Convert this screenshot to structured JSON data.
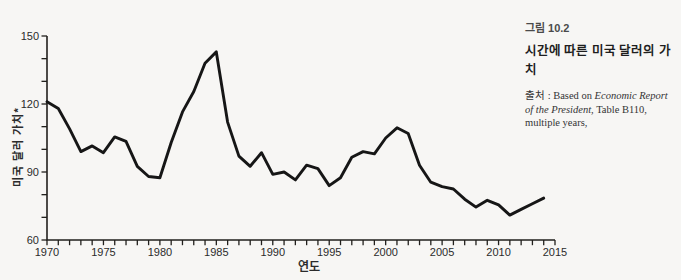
{
  "page": {
    "background_color": "#f7f6f4",
    "line_color": "#161616"
  },
  "figure_caption": {
    "number": "그림 10.2",
    "title": "시간에 따른 미국 달러의 가치",
    "source_label": "출처 : ",
    "source_before_italic": "Based on ",
    "source_italic": "Economic Report of the President",
    "source_after_italic": ", Table B110, multiple years,"
  },
  "chart_data": {
    "type": "line",
    "title": "",
    "xlabel": "연도",
    "ylabel": "미국 달러 가치*",
    "xlim": [
      1970,
      2015
    ],
    "ylim": [
      60,
      150
    ],
    "grid": false,
    "legend": "none",
    "x_tick_labels": [
      "1970",
      "1975",
      "1980",
      "1985",
      "1990",
      "1995",
      "2000",
      "2005",
      "2010",
      "2015"
    ],
    "y_tick_labels": [
      "150",
      "120",
      "90",
      "60"
    ],
    "x_minor_tick_step_years": 1,
    "y_minor_tick_step": 10,
    "series_name": "미국 달러 가치 (US dollar value index)",
    "x": [
      1970,
      1971,
      1972,
      1973,
      1974,
      1975,
      1976,
      1977,
      1978,
      1979,
      1980,
      1981,
      1982,
      1983,
      1984,
      1985,
      1986,
      1987,
      1988,
      1989,
      1990,
      1991,
      1992,
      1993,
      1994,
      1995,
      1996,
      1997,
      1998,
      1999,
      2000,
      2001,
      2002,
      2003,
      2004,
      2005,
      2006,
      2007,
      2008,
      2009,
      2010,
      2011,
      2012,
      2013,
      2014
    ],
    "values": [
      121,
      118,
      109,
      99,
      101.5,
      98.5,
      105.5,
      103.5,
      92.5,
      88,
      87.5,
      103,
      116.5,
      125.5,
      138,
      143,
      112,
      97,
      92.5,
      98.5,
      89,
      90,
      86.5,
      93,
      91.5,
      84,
      87.5,
      96.5,
      99,
      98,
      105,
      109.5,
      107,
      93,
      85.5,
      83.5,
      82.5,
      78,
      74.5,
      77.5,
      75.5,
      71,
      73.5,
      76,
      78.5
    ]
  }
}
